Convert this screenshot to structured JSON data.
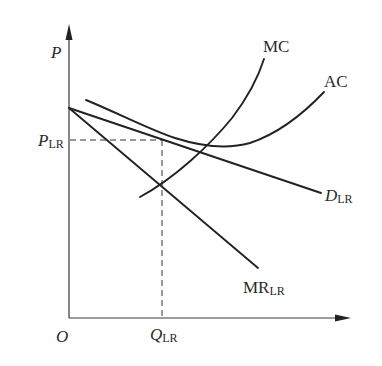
{
  "diagram": {
    "type": "economics-cost-revenue-graph",
    "axes": {
      "y_label": "P",
      "x_origin_label": "O"
    },
    "curves": [
      {
        "id": "MC",
        "label": "MC",
        "subscript": ""
      },
      {
        "id": "AC",
        "label": "AC",
        "subscript": ""
      },
      {
        "id": "D",
        "label": "D",
        "subscript": "LR"
      },
      {
        "id": "MR",
        "label": "MR",
        "subscript": "LR"
      }
    ],
    "equilibrium": {
      "price_label": "P",
      "price_subscript": "LR",
      "quantity_label": "Q",
      "quantity_subscript": "LR"
    },
    "colors": {
      "line": "#222222",
      "axis": "#3a3a3a",
      "background": "#ffffff"
    }
  },
  "labels": {
    "p_axis": "P",
    "origin": "O",
    "mc": "MC",
    "ac": "AC",
    "d_main": "D",
    "d_sub": "LR",
    "mr_main": "MR",
    "mr_sub": "LR",
    "plr_main": "P",
    "plr_sub": "LR",
    "qlr_main": "Q",
    "qlr_sub": "LR"
  }
}
